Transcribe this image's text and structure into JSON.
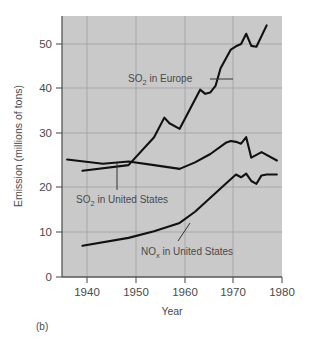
{
  "figure": {
    "caption": "(b)",
    "background_color": "#ffffff",
    "plot_background_color": "#c9c9c9",
    "grid_color": "#9a9a9a",
    "line_color": "#111111",
    "text_color": "#4a4a4a"
  },
  "chart_data": {
    "type": "line",
    "title": "",
    "xlabel": "Year",
    "ylabel": "Emission (millions of tons)",
    "xlim": [
      1937,
      1980
    ],
    "ylim": [
      0,
      56
    ],
    "xticks": [
      1940,
      1950,
      1960,
      1970,
      1980
    ],
    "xtick_labels": [
      "1940",
      "1950",
      "1960",
      "1970",
      "1980"
    ],
    "yticks": [
      0,
      10,
      20,
      30,
      40,
      50
    ],
    "ytick_labels": [
      "0",
      "10",
      "20",
      "30",
      "40",
      "50"
    ],
    "grid": true,
    "legend": "inline-annotations",
    "series": [
      {
        "name": "SO2 in Europe",
        "label_main": "SO",
        "label_sub": "2",
        "label_rest": " in Europe",
        "x": [
          1941,
          1950,
          1955,
          1957,
          1958,
          1960,
          1962,
          1964,
          1965,
          1966,
          1967,
          1968,
          1970,
          1971,
          1972,
          1973,
          1974,
          1975,
          1977
        ],
        "y": [
          22.8,
          24.0,
          30.0,
          34.2,
          33.0,
          31.8,
          36.0,
          40.2,
          39.3,
          39.6,
          41.0,
          44.8,
          48.8,
          49.5,
          50.0,
          52.2,
          49.6,
          49.4,
          54.0
        ]
      },
      {
        "name": "SO2 in United States",
        "label_main": "SO",
        "label_sub": "2",
        "label_rest": " in United States",
        "x": [
          1938,
          1945,
          1950,
          1955,
          1960,
          1963,
          1966,
          1969,
          1970,
          1971,
          1972,
          1973,
          1974,
          1975,
          1976,
          1979
        ],
        "y": [
          25.2,
          24.3,
          24.8,
          24.0,
          23.2,
          24.6,
          26.4,
          28.8,
          29.2,
          29.0,
          28.6,
          30.0,
          25.6,
          26.2,
          26.8,
          25.0
        ]
      },
      {
        "name": "NOx in United States",
        "label_main": "NO",
        "label_sub": "x",
        "label_rest": " in United States",
        "x": [
          1941,
          1950,
          1955,
          1960,
          1963,
          1966,
          1969,
          1971,
          1972,
          1973,
          1974,
          1975,
          1976,
          1977,
          1979
        ],
        "y": [
          6.7,
          8.4,
          9.8,
          11.6,
          14.0,
          17.0,
          20.0,
          22.0,
          21.4,
          22.2,
          20.6,
          20.0,
          21.8,
          22.0,
          22.0
        ]
      }
    ]
  }
}
